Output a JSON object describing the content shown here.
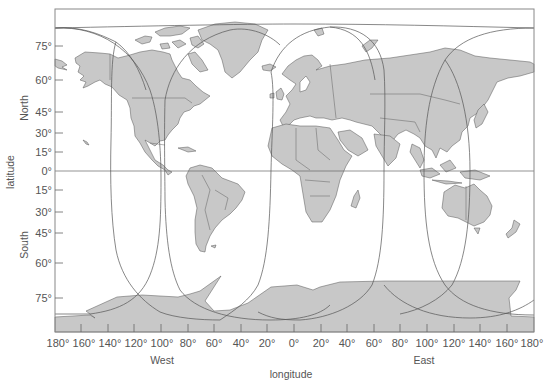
{
  "map": {
    "type": "world map with satellite coverage footprints",
    "projection": "Miller-like cylindrical",
    "colors": {
      "land": "#c8c8c8",
      "land_stroke": "#555555",
      "frame": "#888888",
      "curve": "#555555",
      "text": "#555555",
      "background": "#ffffff"
    },
    "frame": {
      "left": 55,
      "top": 9,
      "right": 534,
      "bottom": 332
    },
    "equator_y": 171
  },
  "axes": {
    "y_title": "latitude",
    "y_north_label": "North",
    "y_south_label": "South",
    "y_ticks": [
      {
        "label": "75°",
        "y": 46
      },
      {
        "label": "60°",
        "y": 80
      },
      {
        "label": "45°",
        "y": 112
      },
      {
        "label": "30°",
        "y": 133
      },
      {
        "label": "15°",
        "y": 152
      },
      {
        "label": "0°",
        "y": 171
      },
      {
        "label": "15°",
        "y": 190
      },
      {
        "label": "30°",
        "y": 212
      },
      {
        "label": "45°",
        "y": 233
      },
      {
        "label": "60°",
        "y": 263
      },
      {
        "label": "75°",
        "y": 298
      }
    ],
    "x_title": "longitude",
    "x_west_label": "West",
    "x_east_label": "East",
    "x_ticks": [
      {
        "label": "180°",
        "x": 55
      },
      {
        "label": "160°",
        "x": 81
      },
      {
        "label": "140°",
        "x": 108
      },
      {
        "label": "120°",
        "x": 134
      },
      {
        "label": "100°",
        "x": 161
      },
      {
        "label": "80°",
        "x": 188
      },
      {
        "label": "60°",
        "x": 214
      },
      {
        "label": "40°",
        "x": 241
      },
      {
        "label": "20°",
        "x": 267
      },
      {
        "label": "0°",
        "x": 294
      },
      {
        "label": "20°",
        "x": 321
      },
      {
        "label": "40°",
        "x": 347
      },
      {
        "label": "60°",
        "x": 374
      },
      {
        "label": "80°",
        "x": 400
      },
      {
        "label": "100°",
        "x": 427
      },
      {
        "label": "120°",
        "x": 454
      },
      {
        "label": "140°",
        "x": 480
      },
      {
        "label": "160°",
        "x": 507
      },
      {
        "label": "180°",
        "x": 534
      }
    ]
  },
  "coverage_footprints": [
    {
      "name": "footprint-1",
      "center_lon": "~120°W",
      "left_x": 110,
      "right_x": 161
    },
    {
      "name": "footprint-2",
      "center_lon": "~60°W",
      "left_x": 165,
      "right_x": 271
    },
    {
      "name": "footprint-3",
      "center_lon": "~30°E",
      "left_x": 271,
      "right_x": 384
    },
    {
      "name": "footprint-4",
      "center_lon": "~135°E",
      "left_x": 424,
      "right_x": 534
    }
  ]
}
